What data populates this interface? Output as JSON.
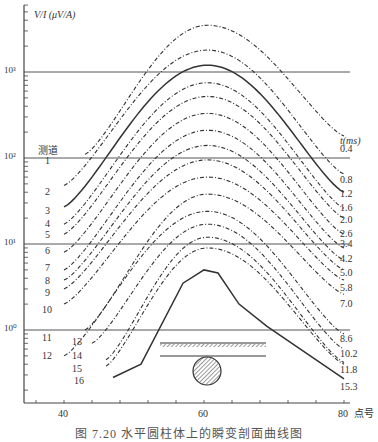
{
  "chart_data": {
    "type": "line",
    "title": "",
    "ylabel": "V/I (μV/A)",
    "xlabel": "点号",
    "y_scale": "log",
    "ylim": [
      0.25,
      4000
    ],
    "xlim": [
      36,
      81
    ],
    "x_ticks": [
      40,
      60,
      80
    ],
    "y_ticks": [
      "10⁰",
      "10¹",
      "10²",
      "10³"
    ],
    "grid": "horizontal lines at each decade",
    "channel_header": "测道",
    "time_header": "t(ms)",
    "series": [
      {
        "channel": "1",
        "time_ms": "0.4",
        "style": "dash-dot",
        "x": [
          43,
          60,
          80
        ],
        "peak": 3500,
        "start": 110,
        "end": 180
      },
      {
        "channel": "2",
        "time_ms": "0.8",
        "style": "dash-dot",
        "x": [
          40,
          60,
          80
        ],
        "peak": 1800,
        "start": 48,
        "end": 65
      },
      {
        "channel": "3",
        "time_ms": "1.2",
        "style": "solid",
        "x": [
          40,
          60,
          80
        ],
        "peak": 1200,
        "start": 27,
        "end": 40
      },
      {
        "channel": "4",
        "time_ms": "1.6",
        "style": "dash-dot",
        "x": [
          40,
          60,
          80
        ],
        "peak": 750,
        "start": 17,
        "end": 26
      },
      {
        "channel": "5",
        "time_ms": "2.0",
        "style": "dash-dot",
        "x": [
          40,
          60,
          80
        ],
        "peak": 520,
        "start": 13,
        "end": 20
      },
      {
        "channel": "6",
        "time_ms": "2.6",
        "style": "dash-dot",
        "x": [
          40,
          60,
          80
        ],
        "peak": 330,
        "start": 8,
        "end": 13
      },
      {
        "channel": "7",
        "time_ms": "3.4",
        "style": "dash-dot",
        "x": [
          40,
          60,
          80
        ],
        "peak": 210,
        "start": 5,
        "end": 9
      },
      {
        "channel": "8",
        "time_ms": "4.2",
        "style": "dash-dot",
        "x": [
          40,
          60,
          80
        ],
        "peak": 140,
        "start": 3.8,
        "end": 6.5
      },
      {
        "channel": "9",
        "time_ms": "5.0",
        "style": "dash-dot",
        "x": [
          40,
          60,
          80
        ],
        "peak": 95,
        "start": 3,
        "end": 5
      },
      {
        "channel": "10",
        "time_ms": "5.8",
        "style": "dash-dot",
        "x": [
          40,
          60,
          80
        ],
        "peak": 60,
        "start": 2,
        "end": 3.8
      },
      {
        "channel": "11",
        "time_ms": "7.0",
        "style": "dash-dot",
        "x": [
          43,
          60,
          80
        ],
        "peak": 38,
        "start": 1,
        "end": 2.6
      },
      {
        "channel": "12",
        "time_ms": "8.6",
        "style": "dash-dot",
        "x": [
          40,
          60,
          80
        ],
        "peak": 24,
        "start": 0.5,
        "end": 0.9
      },
      {
        "channel": "13",
        "time_ms": "10.2",
        "style": "dash-dot",
        "x": [
          44,
          60,
          80
        ],
        "peak": 17,
        "start": 0.7,
        "end": 0.6
      },
      {
        "channel": "14",
        "time_ms": "11.8",
        "style": "dash-dot",
        "x": [
          46,
          60,
          80
        ],
        "peak": 12,
        "start": 0.45,
        "end": 0.42
      },
      {
        "channel": "15",
        "time_ms": "11.8",
        "style": "dash-dot",
        "x": [
          46,
          60,
          80
        ],
        "peak": 9,
        "start": 0.38,
        "end": 0.4
      },
      {
        "channel": "16",
        "time_ms": "15.3",
        "style": "solid",
        "x": [
          47,
          60,
          80
        ],
        "peak": 5,
        "start": 0.28,
        "end": 0.27
      }
    ],
    "channel_labels": [
      "1",
      "2",
      "3",
      "4",
      "5",
      "6",
      "7",
      "8",
      "9",
      "10",
      "11",
      "12",
      "13",
      "14",
      "15",
      "16"
    ],
    "time_labels": [
      "0.4",
      "0.8",
      "1.2",
      "1.6",
      "2.0",
      "2.6",
      "3.4",
      "4.2",
      "5.0",
      "5.8",
      "7.0",
      "8.6",
      "10.2",
      "11.8",
      "15.3"
    ],
    "inset": "horizontal cylinder (hatched circle) beneath hatched ground surface line"
  },
  "axis": {
    "y_title": "V/I (μV/A)",
    "y_ticks": [
      {
        "label": "10³",
        "y": 72
      },
      {
        "label": "10²",
        "y": 158
      },
      {
        "label": "10¹",
        "y": 244
      },
      {
        "label": "10⁰",
        "y": 330
      }
    ],
    "x_ticks": [
      {
        "label": "40",
        "x": 64
      },
      {
        "label": "60",
        "x": 204
      },
      {
        "label": "80",
        "x": 344
      }
    ],
    "x_title": "点号"
  },
  "left_labels": {
    "header": "测道",
    "items": [
      {
        "t": "1",
        "x": 45,
        "y": 161
      },
      {
        "t": "2",
        "x": 45,
        "y": 192
      },
      {
        "t": "3",
        "x": 45,
        "y": 211
      },
      {
        "t": "4",
        "x": 45,
        "y": 224
      },
      {
        "t": "5",
        "x": 45,
        "y": 235
      },
      {
        "t": "6",
        "x": 45,
        "y": 251
      },
      {
        "t": "7",
        "x": 45,
        "y": 268
      },
      {
        "t": "8",
        "x": 45,
        "y": 281
      },
      {
        "t": "9",
        "x": 45,
        "y": 293
      },
      {
        "t": "10",
        "x": 42,
        "y": 310
      },
      {
        "t": "11",
        "x": 42,
        "y": 338
      },
      {
        "t": "12",
        "x": 42,
        "y": 356
      },
      {
        "t": "13",
        "x": 72,
        "y": 342
      },
      {
        "t": "14",
        "x": 72,
        "y": 356
      },
      {
        "t": "15",
        "x": 72,
        "y": 369
      },
      {
        "t": "16",
        "x": 74,
        "y": 381
      }
    ]
  },
  "right_labels": {
    "header": "t(ms)",
    "items": [
      {
        "t": "0.4",
        "y": 149
      },
      {
        "t": "0.8",
        "y": 180
      },
      {
        "t": "1.2",
        "y": 194
      },
      {
        "t": "1.6",
        "y": 208
      },
      {
        "t": "2.0",
        "y": 220
      },
      {
        "t": "2.6",
        "y": 234
      },
      {
        "t": "3.4",
        "y": 244
      },
      {
        "t": "4.2",
        "y": 259
      },
      {
        "t": "5.0",
        "y": 273
      },
      {
        "t": "5.8",
        "y": 288
      },
      {
        "t": "7.0",
        "y": 304
      },
      {
        "t": "8.6",
        "y": 339
      },
      {
        "t": "10.2",
        "y": 354
      },
      {
        "t": "11.8",
        "y": 370
      },
      {
        "t": "15.3",
        "y": 387
      }
    ]
  },
  "caption": "图 7.20  水平圆柱体上的瞬变剖面曲线图"
}
